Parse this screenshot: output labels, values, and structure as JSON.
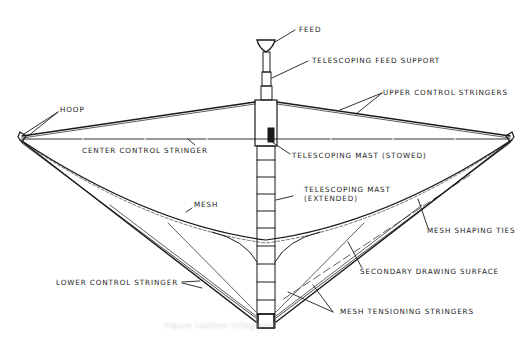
{
  "diagram": {
    "line_color": "#1a1a1a",
    "background": "#ffffff",
    "labels": {
      "feed": "FEED",
      "telescoping_feed_support": "TELESCOPING FEED SUPPORT",
      "upper_control_stringers": "UPPER CONTROL STRINGERS",
      "hoop": "HOOP",
      "center_control_stringer": "CENTER CONTROL STRINGER",
      "telescoping_mast_stowed": "TELESCOPING MAST (STOWED)",
      "mesh": "MESH",
      "telescoping_mast_extended_line1": "TELESCOPING MAST",
      "telescoping_mast_extended_line2": "(EXTENDED)",
      "mesh_shaping_ties": "MESH SHAPING TIES",
      "secondary_drawing_surface": "SECONDARY DRAWING SURFACE",
      "lower_control_stringer": "LOWER CONTROL STRINGER",
      "mesh_tensioning_stringers": "MESH TENSIONING STRINGERS"
    },
    "caption": "Figure caption (illegible)"
  }
}
